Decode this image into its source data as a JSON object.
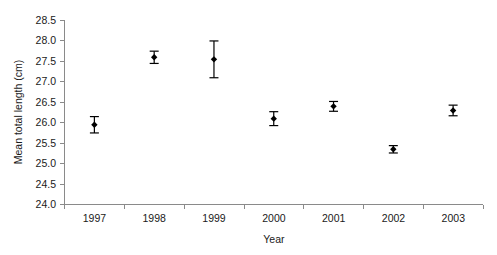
{
  "chart_data": {
    "type": "scatter",
    "title": "",
    "subtitle": "",
    "xlabel": "Year",
    "ylabel": "Mean total length (cm)",
    "categories": [
      "1997",
      "1998",
      "1999",
      "2000",
      "2001",
      "2002",
      "2003"
    ],
    "values": [
      25.95,
      27.6,
      27.55,
      26.1,
      26.4,
      25.35,
      26.3
    ],
    "errors": [
      0.2,
      0.15,
      0.45,
      0.17,
      0.12,
      0.09,
      0.13
    ],
    "error_type": "symmetric",
    "ylim": [
      24.0,
      28.5
    ],
    "ytick_labels": [
      "28.5",
      "28.0",
      "27.5",
      "27.0",
      "26.5",
      "26.0",
      "25.5",
      "25.0",
      "24.5",
      "24.0"
    ],
    "ytick_values": [
      28.5,
      28.0,
      27.5,
      27.0,
      26.5,
      26.0,
      25.5,
      25.0,
      24.5,
      24.0
    ],
    "ytick_step": 0.5,
    "xtick_labels": [
      "1997",
      "1998",
      "1999",
      "2000",
      "2001",
      "2002",
      "2003"
    ],
    "grid": false,
    "legend": "none",
    "marker_style": "filled-diamond-with-error-bars",
    "series": [
      {
        "name": "Mean total length",
        "points": [
          {
            "x": "1997",
            "y": 25.95,
            "err": 0.2
          },
          {
            "x": "1998",
            "y": 27.6,
            "err": 0.15
          },
          {
            "x": "1999",
            "y": 27.55,
            "err": 0.45
          },
          {
            "x": "2000",
            "y": 26.1,
            "err": 0.17
          },
          {
            "x": "2001",
            "y": 26.4,
            "err": 0.12
          },
          {
            "x": "2002",
            "y": 25.35,
            "err": 0.09
          },
          {
            "x": "2003",
            "y": 26.3,
            "err": 0.13
          }
        ]
      }
    ]
  },
  "colors": {
    "marker": "#000000",
    "axis": "#8a8a8a",
    "text": "#1a1a1a",
    "background": "#ffffff"
  },
  "axes": {
    "y_title": "Mean total length (cm)",
    "x_title": "Year"
  },
  "ytick_0": "28.5",
  "ytick_1": "28.0",
  "ytick_2": "27.5",
  "ytick_3": "27.0",
  "ytick_4": "26.5",
  "ytick_5": "26.0",
  "ytick_6": "25.5",
  "ytick_7": "25.0",
  "ytick_8": "24.5",
  "ytick_9": "24.0",
  "xtick_0": "1997",
  "xtick_1": "1998",
  "xtick_2": "1999",
  "xtick_3": "2000",
  "xtick_4": "2001",
  "xtick_5": "2002",
  "xtick_6": "2003"
}
